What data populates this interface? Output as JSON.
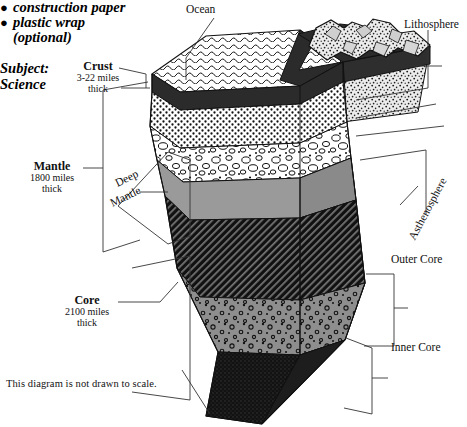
{
  "worksheet": {
    "materials": [
      {
        "marker": "●",
        "text": "construction paper"
      },
      {
        "marker": "●",
        "text": "plastic wrap"
      }
    ],
    "materials_sub": "(optional)",
    "subject_label": "Subject:",
    "subject_value": "Science"
  },
  "diagram": {
    "footnote": "This diagram is not drawn to scale.",
    "labels": {
      "ocean": "Ocean",
      "lithosphere": "Lithosphere",
      "asthenosphere": "Asthenosphere",
      "outer_core": "Outer Core",
      "inner_core": "Inner Core",
      "deep_mantle_line1": "Deep",
      "deep_mantle_line2": "Mantle"
    },
    "callouts": [
      {
        "name": "crust",
        "title": "Crust",
        "sub1": "3-22 miles",
        "sub2": "thick"
      },
      {
        "name": "mantle",
        "title": "Mantle",
        "sub1": "1800 miles",
        "sub2": "thick"
      },
      {
        "name": "core",
        "title": "Core",
        "sub1": "2100 miles",
        "sub2": "thick"
      }
    ],
    "layers": [
      {
        "name": "ocean-surface",
        "fill": "#ffffff",
        "pattern": "waves"
      },
      {
        "name": "continental-crust",
        "fill": "#e8e8e8",
        "pattern": "speckle-coarse"
      },
      {
        "name": "oceanic-crust",
        "fill": "#2c2c2c",
        "pattern": "solid-dark"
      },
      {
        "name": "upper-mantle",
        "fill": "#ffffff",
        "pattern": "dots-fine"
      },
      {
        "name": "transition-zone",
        "fill": "#ffffff",
        "pattern": "pebbles"
      },
      {
        "name": "lower-mantle-grey",
        "fill": "#9a9a9a",
        "pattern": "solid-grey"
      },
      {
        "name": "deep-mantle",
        "fill": "#1a1a1a",
        "pattern": "diagonal-hatch"
      },
      {
        "name": "outer-core",
        "fill": "#8e8e8e",
        "pattern": "bubbles"
      },
      {
        "name": "inner-core",
        "fill": "#151515",
        "pattern": "stipple-dark"
      }
    ],
    "colors": {
      "ink": "#000000",
      "leader": "#333333",
      "grey_mid": "#9a9a9a",
      "grey_core": "#8e8e8e",
      "dark": "#1a1a1a"
    }
  }
}
